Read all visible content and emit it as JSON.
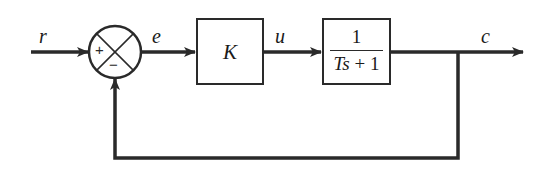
{
  "diagram": {
    "type": "closed-loop negative feedback block diagram",
    "signals": {
      "reference": "r",
      "error": "e",
      "control": "u",
      "output": "c"
    },
    "summing_junction": {
      "plus_sign": "+",
      "minus_sign": "−"
    },
    "blocks": [
      {
        "id": "controller",
        "label": "K"
      },
      {
        "id": "plant",
        "numerator": "1",
        "denominator_var_T": "T",
        "denominator_var_s": "s",
        "denominator_rest": " + 1"
      }
    ],
    "feedback": "unity negative feedback from c to summing junction",
    "colors": {
      "line": "#2a2a2a",
      "background": "#ffffff"
    }
  }
}
